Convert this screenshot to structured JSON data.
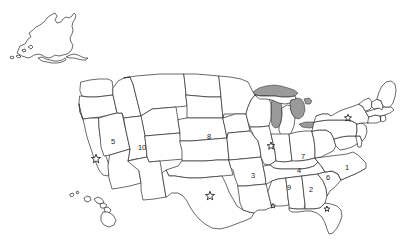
{
  "map": {
    "title": "United States map with numbered states and star markers",
    "background_color": "#ffffff",
    "outline_color": "#2b2b2b",
    "state_fill_color": "#ffffff",
    "lake_fill_color": "#9a9a9a",
    "insets": [
      {
        "name": "alaska",
        "label": "Alaska"
      },
      {
        "name": "hawaii",
        "label": "Hawaii"
      }
    ],
    "numbered_states": [
      {
        "number": "1",
        "state": "North Carolina",
        "x": 347,
        "y": 168
      },
      {
        "number": "2",
        "state": "Georgia",
        "x": 311,
        "y": 190
      },
      {
        "number": "3",
        "state": "Arkansas",
        "x": 253,
        "y": 176
      },
      {
        "number": "4",
        "state": "Tennessee",
        "x": 299,
        "y": 171
      },
      {
        "number": "5",
        "state": "Nevada",
        "x": 113,
        "y": 142
      },
      {
        "number": "6",
        "state": "South Carolina",
        "x": 328,
        "y": 178
      },
      {
        "number": "7",
        "state": "Kentucky",
        "x": 303,
        "y": 157
      },
      {
        "number": "8",
        "state": "Nebraska",
        "x": 209,
        "y": 137
      },
      {
        "number": "9",
        "state": "Mississippi",
        "x": 289,
        "y": 188
      },
      {
        "number": "10",
        "state": "Utah",
        "x": 142,
        "y": 148
      }
    ],
    "star_markers": [
      {
        "name": "star-southern-california",
        "x": 96,
        "y": 159,
        "size": 9.5
      },
      {
        "name": "star-texas",
        "x": 210,
        "y": 196,
        "size": 9.5
      },
      {
        "name": "star-illinois",
        "x": 271,
        "y": 146,
        "size": 8.0
      },
      {
        "name": "star-louisiana-coast",
        "x": 273,
        "y": 206,
        "size": 5.0
      },
      {
        "name": "star-florida",
        "x": 327,
        "y": 209,
        "size": 6.0
      },
      {
        "name": "star-new-england",
        "x": 348,
        "y": 118,
        "size": 7.5
      }
    ]
  }
}
